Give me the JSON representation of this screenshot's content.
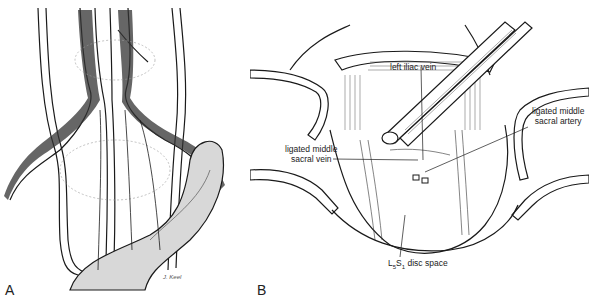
{
  "figure": {
    "panels": [
      {
        "id": "A",
        "letter": "A",
        "description": "Anterior view of great vessels and iliac bifurcation over lumbosacral spine",
        "signature": "J. Keel"
      },
      {
        "id": "B",
        "letter": "B",
        "description": "Retracted surgical field exposing L5-S1 disc space",
        "labels": {
          "left_iliac_vein": "left iliac vein",
          "ligated_sacral_artery_line1": "ligated middle",
          "ligated_sacral_artery_line2": "sacral artery",
          "ligated_sacral_vein_line1": "ligated middle",
          "ligated_sacral_vein_line2": "sacral vein",
          "disc_space_prefix": "L",
          "disc_space_sub1": "5",
          "disc_space_mid": "S",
          "disc_space_sub2": "1",
          "disc_space_suffix": " disc space"
        }
      }
    ],
    "colors": {
      "ink": "#1a1a1a",
      "shade": "#555555",
      "background": "#ffffff"
    }
  }
}
